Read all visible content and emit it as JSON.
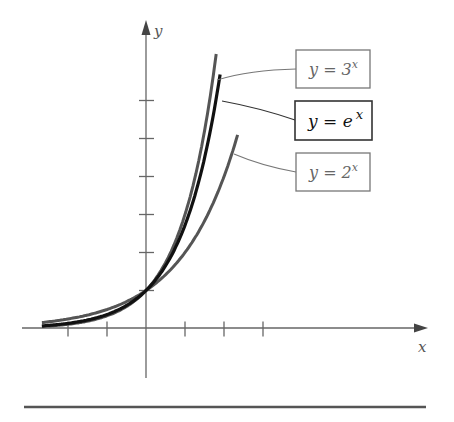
{
  "chart_data": {
    "type": "line",
    "title": "",
    "xlabel": "x",
    "ylabel": "y",
    "x_ticks": [
      -2,
      -1,
      0,
      1,
      2,
      3
    ],
    "y_ticks": [
      1,
      2,
      3,
      4,
      5,
      6
    ],
    "xlim": [
      -3.2,
      7.2
    ],
    "ylim": [
      -1.3,
      7.9
    ],
    "grid": false,
    "legend_position": "boxed labels with leader lines, right",
    "series": [
      {
        "name": "y = 3^x",
        "label_base": "y = 3",
        "label_exp": "x",
        "x_range": [
          -2.67,
          1.8
        ],
        "color": "#555555",
        "width": 3
      },
      {
        "name": "y = e^x",
        "label_base": "y = e",
        "label_exp": "x",
        "x_range": [
          -2.67,
          1.9
        ],
        "color": "#111111",
        "width": 3.2
      },
      {
        "name": "y = 2^x",
        "label_base": "y = 2",
        "label_exp": "x",
        "x_range": [
          -2.67,
          2.35
        ],
        "color": "#555555",
        "width": 3
      }
    ],
    "annotations": [
      "All curves pass through (0, 1)"
    ]
  },
  "axes": {
    "x_label": "x",
    "y_label": "y"
  }
}
